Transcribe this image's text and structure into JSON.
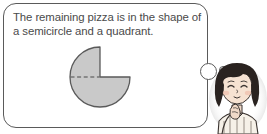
{
  "canvas": {
    "width": 267,
    "height": 134,
    "background": "#ffffff"
  },
  "bubble": {
    "type": "thought-bubble",
    "text": "The remaining pizza is in the shape of a semicircle and a quadrant.",
    "line1": "The remaining pizza is in the shape",
    "line2": "of a semicircle and a quadrant.",
    "border_color": "#5a5a5a",
    "fill_color": "#ffffff",
    "tail": {
      "large_circle_label": "thought-tail-large",
      "small_circle_label": "thought-tail-small"
    }
  },
  "diagram": {
    "name": "remaining-pizza-shape",
    "fill_color": "#c9c9c9",
    "outline_color": "#5a5a5a",
    "dashed_line_color": "#4a4a4a",
    "center_x": 38,
    "center_y": 37,
    "radius": 30,
    "parts": [
      {
        "label": "semicircle",
        "fraction": "1/2"
      },
      {
        "label": "quadrant",
        "fraction": "1/4"
      }
    ],
    "dashed_divider_label": "diameter-dashed-line"
  },
  "character": {
    "name": "thinking-girl",
    "description": "Girl with dark bob haircut, hand on chin in thinking pose, striped shirt",
    "hair_color": "#2a2320",
    "skin_color": "#f2ded0",
    "shirt_color": "#f4efe7",
    "outline_color": "#3a3330"
  }
}
